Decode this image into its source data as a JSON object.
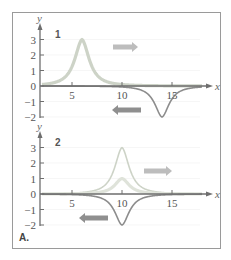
{
  "figure_label": "A.",
  "colors": {
    "frame": "#9a9a9a",
    "axis": "#6e6e6e",
    "light_curve": "#cdd3c7",
    "light_thick_curve": "#dfe3da",
    "dark_curve": "#8c8c8c",
    "arrow_right": "#bdbdbd",
    "arrow_left": "#8f8f8f",
    "grid": "#f0f0f0"
  },
  "chart_data": [
    {
      "type": "line",
      "panel": "1",
      "title": "",
      "xlabel": "x",
      "ylabel": "y",
      "xlim": [
        2,
        18
      ],
      "ylim": [
        -2,
        3
      ],
      "x_ticks": [
        5,
        10,
        15
      ],
      "y_ticks": [
        3,
        2,
        1,
        0,
        -1,
        -2
      ],
      "grid": false,
      "series": [
        {
          "name": "right-moving pulse",
          "shape": "peak",
          "center": 6,
          "amplitude": 3,
          "width": 1.2,
          "color_key": "light_curve",
          "style": "thick"
        },
        {
          "name": "left-moving pulse",
          "shape": "dip",
          "center": 14,
          "amplitude": -2,
          "width": 1.2,
          "color_key": "dark_curve",
          "style": "thin"
        }
      ],
      "annotations": [
        {
          "type": "arrow",
          "direction": "right",
          "color_key": "arrow_right"
        },
        {
          "type": "arrow",
          "direction": "left",
          "color_key": "arrow_left"
        }
      ]
    },
    {
      "type": "line",
      "panel": "2",
      "title": "",
      "xlabel": "x",
      "ylabel": "y",
      "xlim": [
        2,
        18
      ],
      "ylim": [
        -2,
        3
      ],
      "x_ticks": [
        5,
        10,
        15
      ],
      "y_ticks": [
        3,
        2,
        1,
        0,
        -1,
        -2
      ],
      "grid": false,
      "series": [
        {
          "name": "right-moving pulse",
          "shape": "peak",
          "center": 10,
          "amplitude": 3,
          "width": 1.2,
          "color_key": "light_curve",
          "style": "thin"
        },
        {
          "name": "superposition",
          "shape": "peak",
          "center": 10,
          "amplitude": 1,
          "width": 1.2,
          "color_key": "light_thick_curve",
          "style": "thick"
        },
        {
          "name": "left-moving pulse",
          "shape": "dip",
          "center": 10,
          "amplitude": -2,
          "width": 1.2,
          "color_key": "dark_curve",
          "style": "thin"
        }
      ],
      "annotations": [
        {
          "type": "arrow",
          "direction": "right",
          "color_key": "arrow_right"
        },
        {
          "type": "arrow",
          "direction": "left",
          "color_key": "arrow_left"
        }
      ]
    }
  ]
}
